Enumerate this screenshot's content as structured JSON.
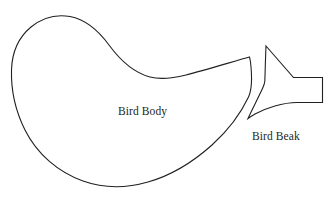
{
  "document": {
    "title": "Bird Pattern Template",
    "background_color": "#ffffff",
    "stroke_color": "#231f20",
    "width": 331,
    "height": 208
  },
  "clipped_header": {
    "text": "bird appliqué pattern pieces",
    "visible": "partially-cut-off-at-top-edge",
    "color": "#e9e9ea"
  },
  "shapes": [
    {
      "name": "bird-body",
      "label": "Bird Body",
      "label_x": 118,
      "label_y": 105,
      "fill": "#ffffff",
      "stroke": "#231f20",
      "path": "M 249.5 57.0 C 235 61 205 70 186 75 C 172 78.5 160 79.5 150 77 C 133 72.5 120 60 109 45 C 98 30 86 19.5 70 16.5 C 56 14 42 18 31 27 C 19 37 12 52 11.5 70 C 11 88 15 110 25 130 C 37 154 58 172 83 181 C 104 188.5 127 188 148 182 C 171 175.5 193 162 212 145 C 228 130.5 241 113 248.5 97 C 252 89.5 252 75 250.5 62 Z"
    },
    {
      "name": "bird-beak",
      "label": "Bird Beak",
      "label_x": 252,
      "label_y": 130,
      "fill": "#ffffff",
      "stroke": "#231f20",
      "path": "M 266.0 46.0 L 293.5 77.5 L 322.5 77.5 L 322.5 102.5 L 297 102.5 C 283 102.5 266 108 255 114 C 252 115.8 249.8 117.2 248.0 118.5 C 252 110 258.5 97 262.5 88.5 C 264 85.2 264.6 83.6 264.8 81.5 C 265 78 265.4 60 266.0 46.0 Z"
    }
  ]
}
